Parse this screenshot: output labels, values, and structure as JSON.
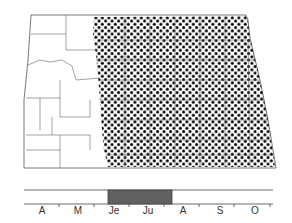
{
  "figure": {
    "type": "range-map-with-phenology",
    "region": "North Dakota counties",
    "shaded_region": "eastern two-thirds (stippled)",
    "colors": {
      "stipple": "#000000",
      "outline": "#555555",
      "flight_bar": "#606060"
    }
  },
  "timeline": {
    "months": [
      "A",
      "M",
      "Je",
      "Ju",
      "A",
      "S",
      "O"
    ],
    "active_period": {
      "start": "early June",
      "end": "late July"
    }
  }
}
